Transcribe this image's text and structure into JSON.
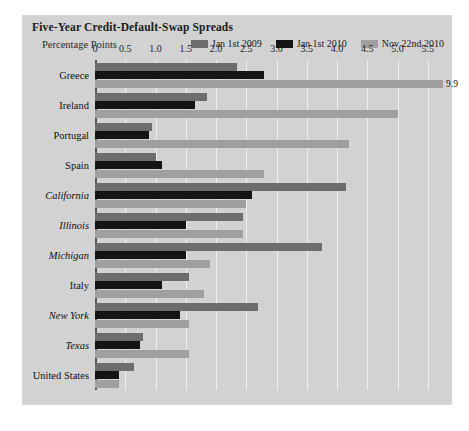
{
  "chart": {
    "title": "Five-Year Credit-Default-Swap Spreads",
    "subtitle": "Percentage Points"
  },
  "legend": [
    {
      "label": "Jan 1st 2009",
      "color": "#6d6d6d"
    },
    {
      "label": "Jan 1st 2010",
      "color": "#141414"
    },
    {
      "label": "Nov 22nd 2010",
      "color": "#9f9f9f"
    }
  ],
  "chart_data": {
    "type": "bar",
    "orientation": "horizontal",
    "title": "Five-Year Credit-Default-Swap Spreads",
    "subtitle": "Percentage Points",
    "xlabel": "Percentage Points",
    "ylabel": "",
    "xlim": [
      0,
      5.75
    ],
    "xticks": [
      0,
      0.5,
      1.0,
      1.5,
      2.0,
      2.5,
      3.0,
      3.5,
      4.0,
      4.5,
      5.0,
      5.5
    ],
    "xticklabels": [
      "0",
      "0.5",
      "1.0",
      "1.5",
      "2.0",
      "2.5",
      "3.0",
      "3.5",
      "4.0",
      "4.5",
      "5.0",
      "5.5"
    ],
    "grid": "vertical",
    "legend_position": "top-right",
    "categories": [
      "Greece",
      "Ireland",
      "Portugal",
      "Spain",
      "California",
      "Illinois",
      "Michigan",
      "Italy",
      "New York",
      "Texas",
      "United States"
    ],
    "category_styles": [
      "normal",
      "normal",
      "normal",
      "normal",
      "italic",
      "italic",
      "italic",
      "normal",
      "italic",
      "italic",
      "normal"
    ],
    "series": [
      {
        "name": "Jan 1st 2009",
        "color": "#6d6d6d",
        "values": [
          2.35,
          1.85,
          0.95,
          1.0,
          4.15,
          2.45,
          3.75,
          1.55,
          2.7,
          0.8,
          0.65
        ]
      },
      {
        "name": "Jan 1st 2010",
        "color": "#141414",
        "values": [
          2.8,
          1.65,
          0.9,
          1.1,
          2.6,
          1.5,
          1.5,
          1.1,
          1.4,
          0.75,
          0.4
        ]
      },
      {
        "name": "Nov 22nd 2010",
        "color": "#9f9f9f",
        "values": [
          5.75,
          5.0,
          4.2,
          2.8,
          2.5,
          2.45,
          1.9,
          1.8,
          1.55,
          1.55,
          0.4
        ]
      }
    ],
    "annotations": [
      {
        "category": "Greece",
        "series": "Nov 22nd 2010",
        "text": "9.9",
        "note": "bar truncated at axis edge"
      }
    ]
  }
}
